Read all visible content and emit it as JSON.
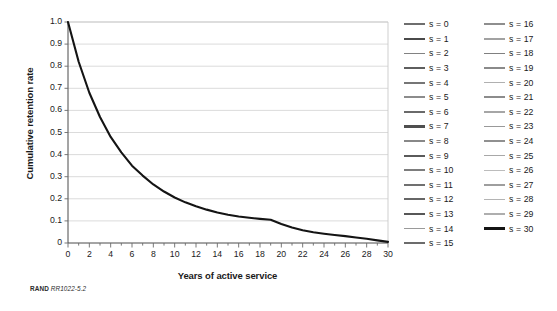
{
  "figure": {
    "source_note_brand": "RAND",
    "source_note_code": "RR1022-5.2"
  },
  "chart_data": {
    "type": "line",
    "title": "",
    "xlabel": "Years of active service",
    "ylabel": "Cumulative retention rate",
    "xlim": [
      0,
      30
    ],
    "ylim": [
      0,
      1.0
    ],
    "grid": "horizontal",
    "legend_position": "right",
    "x_ticks": [
      0,
      2,
      4,
      6,
      8,
      10,
      12,
      14,
      16,
      18,
      20,
      22,
      24,
      26,
      28,
      30
    ],
    "x_tick_labels": [
      "0",
      "2",
      "4",
      "6",
      "8",
      "10",
      "12",
      "14",
      "16",
      "18",
      "20",
      "22",
      "24",
      "26",
      "28",
      "30"
    ],
    "x_minor_tick_step": 1,
    "y_ticks": [
      0,
      0.1,
      0.2,
      0.3,
      0.4,
      0.5,
      0.6,
      0.7,
      0.8,
      0.9,
      1.0
    ],
    "y_tick_labels": [
      "0",
      "0.1",
      "0.2",
      "0.3",
      "0.4",
      "0.5",
      "0.6",
      "0.7",
      "0.8",
      "0.9",
      "1.0"
    ],
    "x": [
      0,
      1,
      2,
      3,
      4,
      5,
      6,
      7,
      8,
      9,
      10,
      11,
      12,
      13,
      14,
      15,
      16,
      17,
      18,
      19,
      20,
      21,
      22,
      23,
      24,
      25,
      26,
      27,
      28,
      29,
      30
    ],
    "series": [
      {
        "name": "s = 30",
        "color": "#141414",
        "width": 2.1,
        "visible": true,
        "values": [
          1.0,
          0.82,
          0.68,
          0.57,
          0.48,
          0.41,
          0.35,
          0.305,
          0.265,
          0.233,
          0.206,
          0.184,
          0.166,
          0.151,
          0.138,
          0.128,
          0.12,
          0.114,
          0.109,
          0.105,
          0.086,
          0.07,
          0.058,
          0.049,
          0.042,
          0.036,
          0.031,
          0.025,
          0.019,
          0.012,
          0.005
        ]
      }
    ],
    "legend_entries": [
      {
        "label": "s = 0",
        "color": "#6e6e6e",
        "width": 1.9
      },
      {
        "label": "s = 1",
        "color": "#4a4a4a",
        "width": 2.2
      },
      {
        "label": "s = 2",
        "color": "#828282",
        "width": 1.7
      },
      {
        "label": "s = 3",
        "color": "#5e5e5e",
        "width": 2.0
      },
      {
        "label": "s = 4",
        "color": "#767676",
        "width": 1.8
      },
      {
        "label": "s = 5",
        "color": "#8c8c8c",
        "width": 1.7
      },
      {
        "label": "s = 6",
        "color": "#6a6a6a",
        "width": 1.9
      },
      {
        "label": "s = 7",
        "color": "#4f4f4f",
        "width": 2.2
      },
      {
        "label": "s = 8",
        "color": "#888888",
        "width": 1.7
      },
      {
        "label": "s = 9",
        "color": "#5a5a5a",
        "width": 2.0
      },
      {
        "label": "s = 10",
        "color": "#7d7d7d",
        "width": 1.8
      },
      {
        "label": "s = 11",
        "color": "#707070",
        "width": 1.9
      },
      {
        "label": "s = 12",
        "color": "#666666",
        "width": 1.9
      },
      {
        "label": "s = 13",
        "color": "#575757",
        "width": 2.0
      },
      {
        "label": "s = 14",
        "color": "#9a9a9a",
        "width": 1.6
      },
      {
        "label": "s = 15",
        "color": "#6c6c6c",
        "width": 1.9
      },
      {
        "label": "s = 16",
        "color": "#8e8e8e",
        "width": 1.7
      },
      {
        "label": "s = 17",
        "color": "#a2a2a2",
        "width": 1.6
      },
      {
        "label": "s = 18",
        "color": "#808080",
        "width": 1.8
      },
      {
        "label": "s = 19",
        "color": "#8a8a8a",
        "width": 1.7
      },
      {
        "label": "s = 20",
        "color": "#b0b0b0",
        "width": 1.5
      },
      {
        "label": "s = 21",
        "color": "#8c8c8c",
        "width": 1.7
      },
      {
        "label": "s = 22",
        "color": "#a6a6a6",
        "width": 1.6
      },
      {
        "label": "s = 23",
        "color": "#999999",
        "width": 1.6
      },
      {
        "label": "s = 24",
        "color": "#909090",
        "width": 1.7
      },
      {
        "label": "s = 25",
        "color": "#a8a8a8",
        "width": 1.6
      },
      {
        "label": "s = 26",
        "color": "#bcbcbc",
        "width": 1.4
      },
      {
        "label": "s = 27",
        "color": "#9e9e9e",
        "width": 1.6
      },
      {
        "label": "s = 28",
        "color": "#b4b4b4",
        "width": 1.5
      },
      {
        "label": "s = 29",
        "color": "#aeaeae",
        "width": 1.5
      },
      {
        "label": "s = 30",
        "color": "#141414",
        "width": 2.4
      }
    ]
  }
}
